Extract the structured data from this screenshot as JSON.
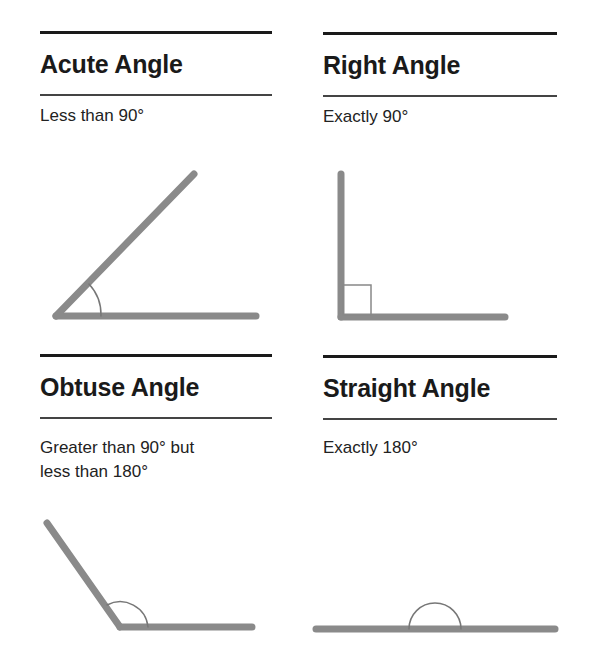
{
  "panels": [
    {
      "id": "acute",
      "title": "Acute Angle",
      "description_parts": [
        "Less than 90",
        "°"
      ],
      "description_lines": [
        "Less than 90°"
      ]
    },
    {
      "id": "right",
      "title": "Right Angle",
      "description_lines": [
        "Exactly 90°"
      ]
    },
    {
      "id": "obtuse",
      "title": "Obtuse Angle",
      "description_lines": [
        "Greater than 90° but",
        "less than 180°"
      ]
    },
    {
      "id": "straight",
      "title": "Straight Angle",
      "description_lines": [
        "Exactly 180°"
      ]
    }
  ],
  "colors": {
    "ray": "#8a8a8a",
    "arc": "#777777",
    "rule": "#1a1a1a"
  }
}
